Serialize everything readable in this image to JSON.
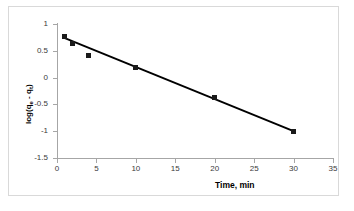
{
  "chart_data": {
    "type": "scatter",
    "title": "",
    "xlabel": "Time, min",
    "ylabel": "log(qe - qt)",
    "ylabel_parts": {
      "prefix": "log(q",
      "sub1": "e",
      "middle": " - q",
      "sub2": "t",
      "suffix": ")"
    },
    "x": [
      1,
      2,
      4,
      10,
      20,
      30
    ],
    "values": [
      0.77,
      0.63,
      0.42,
      0.19,
      -0.38,
      -1.0
    ],
    "series": [
      {
        "name": "data",
        "marker": "square",
        "color": "#1a1a1a",
        "points": [
          {
            "x": 1,
            "y": 0.77
          },
          {
            "x": 2,
            "y": 0.63
          },
          {
            "x": 4,
            "y": 0.42
          },
          {
            "x": 10,
            "y": 0.19
          },
          {
            "x": 20,
            "y": -0.38
          },
          {
            "x": 30,
            "y": -1.0
          }
        ]
      },
      {
        "name": "trendline",
        "type": "line",
        "color": "#000000",
        "endpoints": [
          {
            "x": 1.0,
            "y": 0.735
          },
          {
            "x": 30.0,
            "y": -1.0
          }
        ]
      }
    ],
    "xlim": [
      0,
      35
    ],
    "ylim": [
      -1.5,
      1
    ],
    "xticks": [
      0,
      5,
      10,
      15,
      20,
      25,
      30,
      35
    ],
    "yticks": [
      1,
      0.5,
      0,
      -0.5,
      -1,
      -1.5
    ],
    "xtick_labels": [
      "0",
      "5",
      "10",
      "15",
      "20",
      "25",
      "30",
      "35"
    ],
    "ytick_labels": [
      "1",
      "0.5",
      "0",
      "-0.5",
      "-1",
      "-1.5"
    ],
    "grid": false,
    "legend": null,
    "legend_position": "none"
  },
  "colors": {
    "axis": "#a6a6a6",
    "marker": "#1a1a1a",
    "trendline": "#000000",
    "frame": "#d9d9d9",
    "tick_label": "#3a3a3a",
    "background": "#ffffff"
  }
}
